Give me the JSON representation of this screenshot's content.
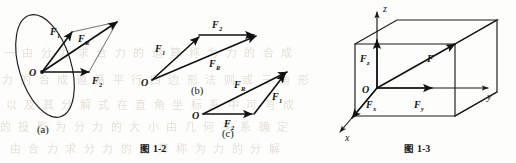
{
  "page": {
    "width": 516,
    "height": 163,
    "background": "#fdfdfb",
    "ink": "#111111"
  },
  "figure_1_2": {
    "caption_prefix": "图",
    "caption_number": "1-2",
    "caption_full": "图 1-2",
    "parts": [
      {
        "key": "a",
        "label": "(a)",
        "description": "parallelogram rule for two forces drawn inside a tilted ellipse (plane)",
        "origin_label": "O",
        "vectors": [
          {
            "name": "F1",
            "label": "F",
            "subscript": "1"
          },
          {
            "name": "FR",
            "label": "F",
            "subscript": "R"
          },
          {
            "name": "F2",
            "label": "F",
            "subscript": "2"
          }
        ]
      },
      {
        "key": "b",
        "label": "(b)",
        "description": "triangle rule, F1 then F2 head to tail giving resultant FR",
        "origin_label": "O",
        "vectors": [
          {
            "name": "F1",
            "label": "F",
            "subscript": "1"
          },
          {
            "name": "F2",
            "label": "F",
            "subscript": "2"
          },
          {
            "name": "FR",
            "label": "F",
            "subscript": "R"
          }
        ]
      },
      {
        "key": "c",
        "label": "(c)",
        "description": "triangle rule, F2 then F1 head to tail giving the same resultant FR",
        "origin_label": "O",
        "vectors": [
          {
            "name": "FR",
            "label": "F",
            "subscript": "R"
          },
          {
            "name": "F1",
            "label": "F",
            "subscript": "1"
          },
          {
            "name": "F2",
            "label": "F",
            "subscript": "2"
          }
        ]
      }
    ]
  },
  "figure_1_3": {
    "caption_prefix": "图",
    "caption_number": "1-3",
    "caption_full": "图 1-3",
    "description": "rectangular box showing the decomposition of force F into components Fx, Fy, Fz along the coordinate axes",
    "origin_label": "O",
    "axes": [
      {
        "name": "z-axis",
        "label": "z"
      },
      {
        "name": "y-axis",
        "label": "y"
      },
      {
        "name": "x-axis",
        "label": "x"
      }
    ],
    "vectors": [
      {
        "name": "F",
        "label": "F",
        "subscript": ""
      },
      {
        "name": "Fz",
        "label": "F",
        "subscript": "z"
      },
      {
        "name": "Fx",
        "label": "F",
        "subscript": "x"
      },
      {
        "name": "Fy",
        "label": "F",
        "subscript": "y"
      }
    ]
  },
  "bleed_through": {
    "note": "faint mirrored text showing through from the reverse page of the scan",
    "rows": [
      "一 由 分 力 求 合 力 的 运 算 称 为 力 的 合 成",
      "力 的 合 成 遵 循 平 行 四 边 形 法 则 或 三 角 形",
      "以 及 其 分 解 式 在 直 角 坐 标 系 中 可 写 成",
      "的 投 影 为 分 力 的 大 小 由 几 何 关 系 确 定",
      "由 合 力 求 分 力 的 运 算 称 为 力 的 分 解"
    ]
  }
}
